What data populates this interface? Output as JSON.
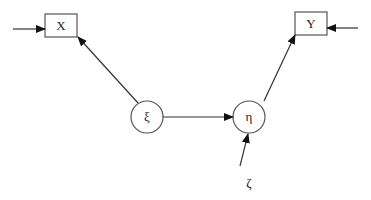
{
  "diagram": {
    "type": "path-diagram",
    "nodes": {
      "x": {
        "label": "X",
        "shape": "rectangle"
      },
      "y": {
        "label": "Y",
        "shape": "rectangle"
      },
      "xi": {
        "label": "ξ",
        "shape": "circle"
      },
      "eta": {
        "label": "η",
        "shape": "circle"
      },
      "zeta": {
        "label": "ζ",
        "shape": "text"
      }
    },
    "edges": [
      {
        "from": "external",
        "to": "X"
      },
      {
        "from": "ξ",
        "to": "X"
      },
      {
        "from": "ξ",
        "to": "η"
      },
      {
        "from": "η",
        "to": "Y"
      },
      {
        "from": "external",
        "to": "Y"
      },
      {
        "from": "ζ",
        "to": "η"
      }
    ],
    "colors": {
      "stroke": "#333333",
      "background": "#ffffff"
    }
  }
}
